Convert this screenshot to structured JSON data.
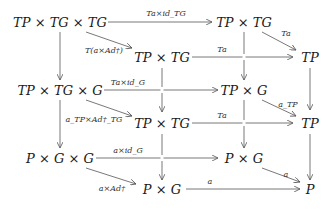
{
  "diagram": {
    "type": "commutative-diagram",
    "nodes": {
      "n1": "TP × TG × TG",
      "n2": "TP × TG",
      "n3": "TP × TG",
      "n4": "TP",
      "n5": "TP × TG × G",
      "n6": "TP × G",
      "n7": "TP × TG",
      "n8": "TP",
      "n9": "P × G × G",
      "n10": "P × G",
      "n11": "P × G",
      "n12": "P"
    },
    "edges": {
      "e1": "Ta×id_TG",
      "e2": "Ta",
      "e3": "T(a×Ad†)",
      "e4": "Ta",
      "e5": "Ta×id_G",
      "e6": "a_TP",
      "e7": "a_TP×Ad†_TG",
      "e8": "Ta",
      "e9": "a×id_G",
      "e10": "a",
      "e11": "a×Ad†",
      "e12": "a"
    }
  }
}
